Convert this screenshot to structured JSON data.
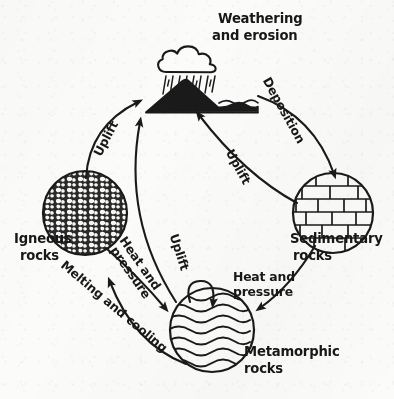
{
  "diagram": {
    "name": "rock-cycle-diagram",
    "title": "Weathering\nand erosion",
    "ink_color": "#1a1a1a",
    "paper_color": "#fbfbfa",
    "nodes": [
      {
        "id": "weathering-erosion",
        "label": "Weathering\nand erosion",
        "kind": "scene",
        "sublabel": "cloud-rain-mountain-sea"
      },
      {
        "id": "igneous-rocks",
        "label": "Igneous\nrocks",
        "kind": "circle",
        "texture": "speckled-granular"
      },
      {
        "id": "sedimentary-rocks",
        "label": "Sedimentary\nrocks",
        "kind": "circle",
        "texture": "brick-layers"
      },
      {
        "id": "metamorphic-rocks",
        "label": "Metamorphic\nrocks",
        "kind": "circle",
        "texture": "wavy-foliation"
      }
    ],
    "arrows": [
      {
        "id": "arrow-uplift-igneous",
        "label": "Uplift",
        "from": "igneous-rocks",
        "to": "weathering-erosion"
      },
      {
        "id": "arrow-deposition",
        "label": "Deposition",
        "from": "weathering-erosion",
        "to": "sedimentary-rocks"
      },
      {
        "id": "arrow-uplift-sedimentary",
        "label": "Uplift",
        "from": "sedimentary-rocks",
        "to": "weathering-erosion"
      },
      {
        "id": "arrow-uplift-metamorphic",
        "label": "Uplift",
        "from": "metamorphic-rocks",
        "to": "weathering-erosion"
      },
      {
        "id": "arrow-heat-pressure-igneous",
        "label": "Heat and\npressure",
        "from": "igneous-rocks",
        "to": "metamorphic-rocks"
      },
      {
        "id": "arrow-heat-pressure-sedimentary",
        "label": "Heat and\npressure",
        "from": "sedimentary-rocks",
        "to": "metamorphic-rocks"
      },
      {
        "id": "arrow-melting-cooling",
        "label": "Melting and cooling",
        "from": "metamorphic-rocks",
        "to": "igneous-rocks"
      },
      {
        "id": "arrow-heat-pressure-self",
        "label": "",
        "from": "metamorphic-rocks",
        "to": "metamorphic-rocks"
      }
    ],
    "labels": {
      "title": "Weathering",
      "title_line2": "and erosion",
      "igneous_line1": "Igneous",
      "igneous_line2": "rocks",
      "sedimentary_line1": "Sedimentary",
      "sedimentary_line2": "rocks",
      "metamorphic_line1": "Metamorphic",
      "metamorphic_line2": "rocks",
      "uplift_left": "Uplift",
      "uplift_center": "Uplift",
      "uplift_right": "Uplift",
      "deposition": "Deposition",
      "heat_pressure_left_l1": "Heat and",
      "heat_pressure_left_l2": "pressure",
      "heat_pressure_right_l1": "Heat and",
      "heat_pressure_right_l2": "pressure",
      "melting_cooling": "Melting and cooling"
    }
  }
}
